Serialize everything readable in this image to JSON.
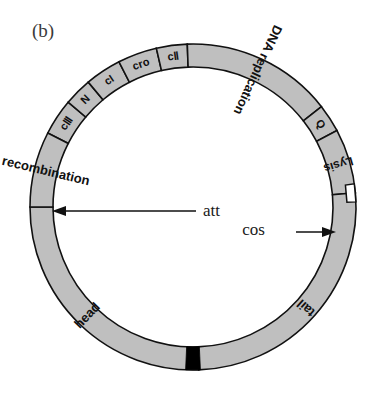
{
  "figure": {
    "panel_label": "(b)",
    "diagram_type": "circular-genome-map",
    "colors": {
      "ring_fill": "#bfbfbf",
      "ring_stroke": "#111111",
      "att_band": "#000000",
      "background": "#ffffff",
      "text": "#111111"
    }
  },
  "geometry": {
    "center_x": 193,
    "center_y": 207,
    "outer_radius": 163,
    "inner_radius": 140
  },
  "segments": [
    {
      "id": "cIII",
      "label": "cⅢ",
      "start_deg": -63,
      "end_deg": -50,
      "font_size": 11,
      "orient": "radial"
    },
    {
      "id": "N",
      "label": "N",
      "start_deg": -50,
      "end_deg": -40,
      "font_size": 11,
      "orient": "radial"
    },
    {
      "id": "cI",
      "label": "cI",
      "start_deg": -40,
      "end_deg": -27,
      "font_size": 11,
      "orient": "radial"
    },
    {
      "id": "cro",
      "label": "cro",
      "start_deg": -27,
      "end_deg": -13,
      "font_size": 11,
      "orient": "radial"
    },
    {
      "id": "cII",
      "label": "cⅡ",
      "start_deg": -13,
      "end_deg": -2,
      "font_size": 11,
      "orient": "radial"
    },
    {
      "id": "dna-replication",
      "label": "DNA replication",
      "start_deg": -2,
      "end_deg": 52,
      "font_size": 13,
      "orient": "tangential"
    },
    {
      "id": "Q",
      "label": "Q",
      "start_deg": 52,
      "end_deg": 62,
      "font_size": 11,
      "orient": "radial"
    },
    {
      "id": "lysis",
      "label": "Lysis",
      "start_deg": 62,
      "end_deg": 85,
      "font_size": 12,
      "orient": "tangential"
    },
    {
      "id": "tail",
      "label": "tail",
      "start_deg": 85,
      "end_deg": 178,
      "font_size": 13,
      "orient": "tangential"
    },
    {
      "id": "head",
      "label": "head",
      "start_deg": 178,
      "end_deg": 270,
      "font_size": 13,
      "orient": "tangential"
    },
    {
      "id": "recombination",
      "label": "recombination",
      "start_deg": 270,
      "end_deg": 297,
      "font_size": 13,
      "orient": "tangential"
    }
  ],
  "sites": [
    {
      "id": "att",
      "label": "att",
      "angle_deg": 180,
      "marker": "black-band",
      "arrow_direction": "left",
      "text_x": 203,
      "text_y": 214
    },
    {
      "id": "cos",
      "label": "cos",
      "angle_deg": 85,
      "marker": "step-notch",
      "arrow_direction": "right",
      "text_x": 265,
      "text_y": 232
    }
  ]
}
